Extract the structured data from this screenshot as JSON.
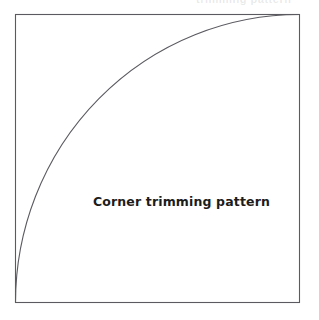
{
  "page": {
    "width": 319,
    "height": 320,
    "background_color": "#ffffff"
  },
  "figure": {
    "caption": "Corner trimming pattern",
    "caption_color": "#1c1c1c",
    "stroke_color": "#5a5a60",
    "fill_color": "#ffffff",
    "stroke_width": 1
  },
  "top_artifact": {
    "text": "trimming pattern",
    "color": "#78787d"
  },
  "chart_data": {
    "type": "diagram",
    "title": "Corner trimming pattern",
    "shapes": [
      {
        "name": "bounding-square",
        "kind": "rect",
        "x": 15.5,
        "y": 14.5,
        "width": 284,
        "height": 288,
        "stroke": "#5a5a60",
        "fill": "#ffffff"
      },
      {
        "name": "quarter-circle-arc",
        "kind": "arc",
        "center_x": 299.5,
        "center_y": 302.5,
        "radius_x": 284,
        "radius_y": 288,
        "start_point": [
          15.5,
          302.5
        ],
        "end_point": [
          299.5,
          14.5
        ],
        "sweep": "counterclockwise",
        "angle_degrees": 90,
        "stroke": "#5a5a60",
        "fill": "none"
      }
    ],
    "labels": [
      {
        "name": "caption",
        "text": "Corner trimming pattern",
        "x": 182,
        "y": 202,
        "anchor": "middle",
        "bold": true,
        "font_size": 12.5
      }
    ],
    "axis_ranges": null,
    "grid": false,
    "legend": null
  }
}
